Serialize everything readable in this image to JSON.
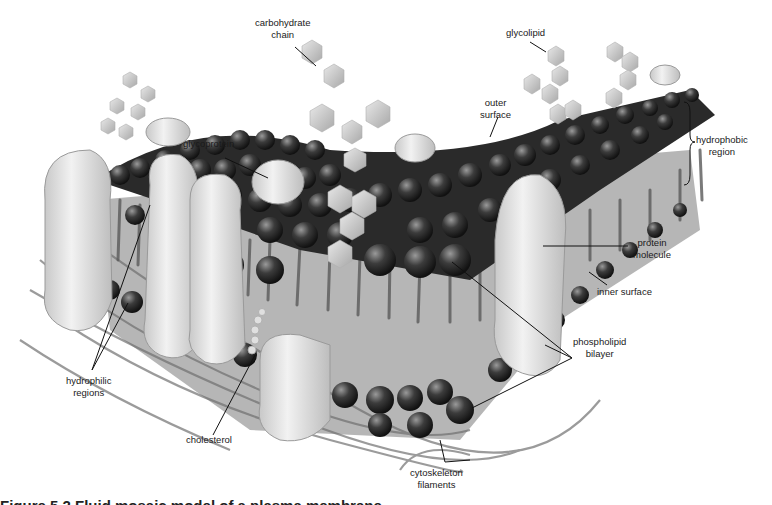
{
  "figure": {
    "caption": "Figure 5.2 Fluid mosaic model of a plasma membrane",
    "labels": {
      "carbohydrate_chain": [
        "carbohydrate",
        "chain"
      ],
      "glycolipid": [
        "glycolipid"
      ],
      "glycoprotein": [
        "glycoprotein"
      ],
      "outer_surface": [
        "outer",
        "surface"
      ],
      "hydrophobic_region": [
        "hydrophobic",
        "region"
      ],
      "protein_molecule": [
        "protein",
        "molecule"
      ],
      "inner_surface": [
        "inner surface"
      ],
      "phospholipid_bilayer": [
        "phospholipid",
        "bilayer"
      ],
      "hydrophilic_regions": [
        "hydrophilic",
        "regions"
      ],
      "cholesterol": [
        "cholesterol"
      ],
      "cytoskeleton_filaments": [
        "cytoskeleton",
        "filaments"
      ]
    }
  }
}
